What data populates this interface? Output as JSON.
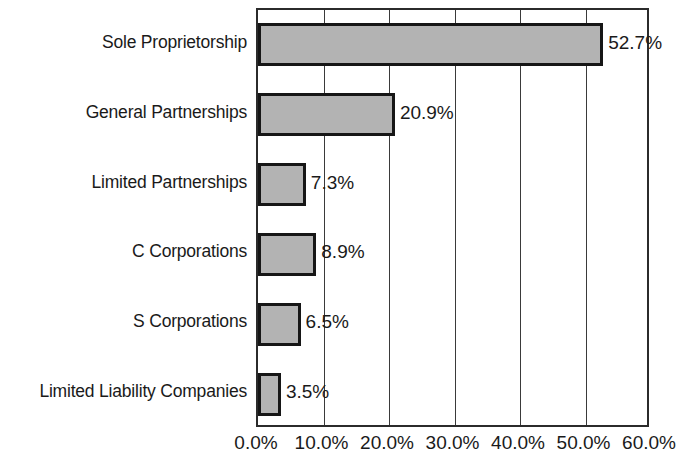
{
  "chart_data": {
    "type": "bar",
    "orientation": "horizontal",
    "title": "",
    "subtitle": "",
    "xlabel": "",
    "ylabel": "",
    "xlim": [
      0,
      60
    ],
    "ylim": null,
    "grid": true,
    "legend": null,
    "legend_position": "none",
    "categories": [
      "Sole Proprietorship",
      "General Partnerships",
      "Limited Partnerships",
      "C Corporations",
      "S Corporations",
      "Limited Liability Companies"
    ],
    "values": [
      52.7,
      20.9,
      7.3,
      8.9,
      6.5,
      3.5
    ],
    "data_labels": [
      "52.7%",
      "20.9%",
      "7.3%",
      "8.9%",
      "6.5%",
      "3.5%"
    ],
    "xticks": [
      0,
      10,
      20,
      30,
      40,
      50,
      60
    ],
    "xtick_labels": [
      "0.0%",
      "10.0%",
      "20.0%",
      "30.0%",
      "40.0%",
      "50.0%",
      "60.0%"
    ],
    "bar_fill_color": "#b3b3b3",
    "bar_border_color": "#161616",
    "axis_color": "#2b2b2b",
    "gridline_color": "#3a3a3a",
    "text_color": "#1a1a1a"
  }
}
